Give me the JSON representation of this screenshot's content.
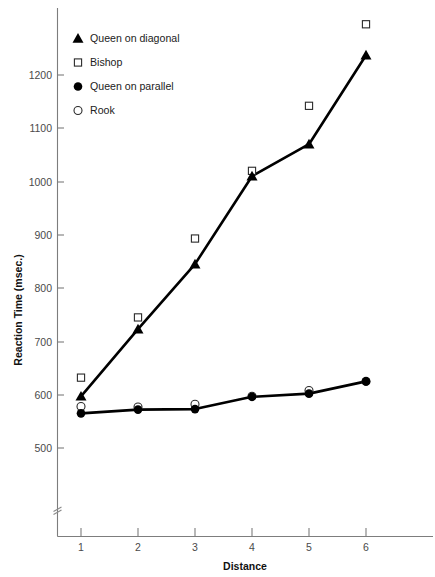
{
  "chart_data": {
    "type": "scatter",
    "title": "",
    "xlabel": "Distance",
    "ylabel": "Reaction Time (msec.)",
    "x": [
      1,
      2,
      3,
      4,
      5,
      6
    ],
    "xlim": [
      0.6,
      6.7
    ],
    "ylim": [
      440,
      1310
    ],
    "xticks": [
      1,
      2,
      3,
      4,
      5,
      6
    ],
    "yticks": [
      500,
      600,
      700,
      800,
      900,
      1000,
      1100,
      1200
    ],
    "grid": false,
    "legend_position": "top-left",
    "axis_break": true,
    "series": [
      {
        "name": "Queen on diagonal",
        "marker": "filled-triangle",
        "trendline": true,
        "values": [
          597,
          723,
          845,
          1010,
          1070,
          1237
        ]
      },
      {
        "name": "Bishop",
        "marker": "open-square",
        "trendline": false,
        "values": [
          632,
          745,
          893,
          1020,
          1142,
          1295
        ]
      },
      {
        "name": "Queen on parallel",
        "marker": "filled-circle",
        "trendline": true,
        "values": [
          565,
          572,
          573,
          596,
          602,
          625
        ]
      },
      {
        "name": "Rook",
        "marker": "open-circle",
        "trendline": false,
        "values": [
          578,
          577,
          582,
          597,
          608,
          625
        ]
      }
    ]
  },
  "axis": {
    "y_title": "Reaction Time (msec.)",
    "x_title": "Distance",
    "y_tick_labels": [
      "500",
      "600",
      "700",
      "800",
      "900",
      "1000",
      "1100",
      "1200"
    ],
    "x_tick_labels": [
      "1",
      "2",
      "3",
      "4",
      "5",
      "6"
    ]
  },
  "legend": {
    "items": [
      {
        "label": "Queen on diagonal",
        "marker": "filled-triangle"
      },
      {
        "label": "Bishop",
        "marker": "open-square"
      },
      {
        "label": "Queen on parallel",
        "marker": "filled-circle"
      },
      {
        "label": "Rook",
        "marker": "open-circle"
      }
    ]
  },
  "colors": {
    "ink": "#000000",
    "axis": "#7d7d7d",
    "tick_text": "#4a4a4a",
    "background": "#ffffff"
  }
}
